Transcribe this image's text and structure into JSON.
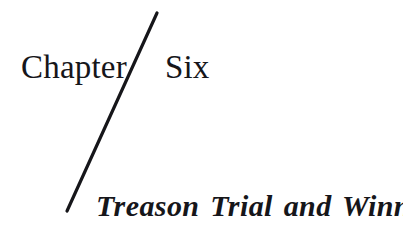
{
  "page": {
    "background_color": "#ffffff",
    "ink_color": "#16161a",
    "width": 403,
    "height": 238
  },
  "heading": {
    "chapter_word": "Chapter",
    "chapter_number": "Six",
    "full_text": "Chapter Six"
  },
  "subtitle": {
    "text": "Treason Trial and Winnie"
  },
  "divider": {
    "name": "diagonal-rule",
    "color": "#16161a",
    "x1": 157,
    "y1": 13,
    "x2": 67,
    "y2": 211,
    "thickness": 3.2
  }
}
